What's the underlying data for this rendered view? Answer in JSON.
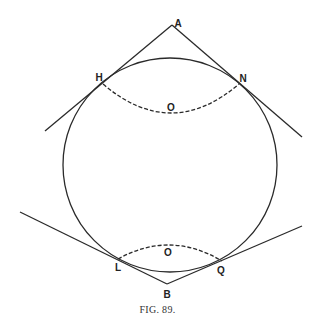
{
  "figure": {
    "caption": "FIG. 89.",
    "circle": {
      "cx": 170,
      "cy": 165,
      "r": 107
    },
    "points": {
      "A": {
        "label": "A",
        "x": 172,
        "y": 25,
        "lx": 178,
        "ly": 24
      },
      "H": {
        "label": "H",
        "x": 103,
        "y": 84,
        "lx": 99,
        "ly": 78
      },
      "N": {
        "label": "N",
        "x": 239,
        "y": 84,
        "lx": 243,
        "ly": 79
      },
      "O_upper": {
        "label": "O",
        "lx": 171,
        "ly": 108
      },
      "L": {
        "label": "L",
        "x": 118,
        "y": 259,
        "lx": 118,
        "ly": 268
      },
      "Q": {
        "label": "Q",
        "x": 222,
        "y": 261,
        "lx": 221,
        "ly": 271
      },
      "O_lower": {
        "label": "O",
        "lx": 168,
        "ly": 253
      },
      "B": {
        "label": "B",
        "x": 167,
        "y": 284,
        "lx": 167,
        "ly": 295
      }
    },
    "tangent_lines": [
      {
        "name": "tangent-line-a-h",
        "x1": 172,
        "y1": 25,
        "x2": 45,
        "y2": 131
      },
      {
        "name": "tangent-line-a-n",
        "x1": 172,
        "y1": 25,
        "x2": 302,
        "y2": 137
      },
      {
        "name": "tangent-line-b-l",
        "x1": 167,
        "y1": 284,
        "x2": 20,
        "y2": 212
      },
      {
        "name": "tangent-line-b-q",
        "x1": 167,
        "y1": 284,
        "x2": 302,
        "y2": 226
      }
    ],
    "dashed_arcs": [
      {
        "name": "dashed-arc-upper",
        "d": "M103,84 Q171,142 239,84"
      },
      {
        "name": "dashed-arc-lower",
        "d": "M118,259 Q170,230 222,261"
      }
    ],
    "colors": {
      "stroke": "#2a2a2a",
      "background": "#ffffff"
    }
  }
}
